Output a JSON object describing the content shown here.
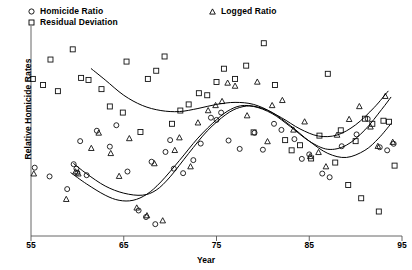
{
  "chart_data": {
    "type": "scatter",
    "title": "",
    "xlabel": "Year",
    "ylabel": "Relative Homicide Rates",
    "xlim": [
      55,
      95
    ],
    "ylim": [
      0,
      100
    ],
    "xticks": [
      55,
      65,
      75,
      85,
      95
    ],
    "yticks": [],
    "grid": false,
    "legend_position": "top",
    "axis_style": "left-spine-and-bottom-axis",
    "series": [
      {
        "name": "Homicide Ratio",
        "marker": "circle-open",
        "color": "#000000",
        "points": [
          [
            55.4,
            33.5
          ],
          [
            57.0,
            29.2
          ],
          [
            58.9,
            23.0
          ],
          [
            59.6,
            35.2
          ],
          [
            59.9,
            33.0
          ],
          [
            60.0,
            31.0
          ],
          [
            60.3,
            46.5
          ],
          [
            61.0,
            29.8
          ],
          [
            62.1,
            51.6
          ],
          [
            63.5,
            43.8
          ],
          [
            64.2,
            54.3
          ],
          [
            65.4,
            31.6
          ],
          [
            66.6,
            12.5
          ],
          [
            67.4,
            9.3
          ],
          [
            68.0,
            36.4
          ],
          [
            68.4,
            5.8
          ],
          [
            69.5,
            41.2
          ],
          [
            70.0,
            47.0
          ],
          [
            70.4,
            33.0
          ],
          [
            71.4,
            30.8
          ],
          [
            72.5,
            37.2
          ],
          [
            73.3,
            45.3
          ],
          [
            74.4,
            58.0
          ],
          [
            75.0,
            56.9
          ],
          [
            75.5,
            60.5
          ],
          [
            76.3,
            46.8
          ],
          [
            77.5,
            42.7
          ],
          [
            79.1,
            50.6
          ],
          [
            80.0,
            42.3
          ],
          [
            81.2,
            55.0
          ],
          [
            82.0,
            52.0
          ],
          [
            83.4,
            47.5
          ],
          [
            84.2,
            37.8
          ],
          [
            85.0,
            40.0
          ],
          [
            86.4,
            30.6
          ],
          [
            87.2,
            28.8
          ],
          [
            88.5,
            44.0
          ],
          [
            90.1,
            49.8
          ],
          [
            91.3,
            57.4
          ],
          [
            92.6,
            43.5
          ],
          [
            93.4,
            42.0
          ],
          [
            94.1,
            45.2
          ]
        ]
      },
      {
        "name": "Residual Deviation",
        "marker": "square-open",
        "color": "#000000",
        "points": [
          [
            55.2,
            77.0
          ],
          [
            56.3,
            74.0
          ],
          [
            57.1,
            86.5
          ],
          [
            57.9,
            71.0
          ],
          [
            59.5,
            91.5
          ],
          [
            60.4,
            77.5
          ],
          [
            61.2,
            76.5
          ],
          [
            62.6,
            72.0
          ],
          [
            63.5,
            63.5
          ],
          [
            64.9,
            60.5
          ],
          [
            65.3,
            85.5
          ],
          [
            66.8,
            51.0
          ],
          [
            67.6,
            77.0
          ],
          [
            68.5,
            81.0
          ],
          [
            69.4,
            88.0
          ],
          [
            70.2,
            55.0
          ],
          [
            71.1,
            61.5
          ],
          [
            72.0,
            64.5
          ],
          [
            73.1,
            70.0
          ],
          [
            74.0,
            69.0
          ],
          [
            75.0,
            75.5
          ],
          [
            75.8,
            82.0
          ],
          [
            77.0,
            77.0
          ],
          [
            78.2,
            83.5
          ],
          [
            79.0,
            50.8
          ],
          [
            80.1,
            94.5
          ],
          [
            81.3,
            74.0
          ],
          [
            82.4,
            47.0
          ],
          [
            83.1,
            42.0
          ],
          [
            84.0,
            44.5
          ],
          [
            85.2,
            38.0
          ],
          [
            86.1,
            49.2
          ],
          [
            87.0,
            79.5
          ],
          [
            87.8,
            36.0
          ],
          [
            88.4,
            51.8
          ],
          [
            89.2,
            25.0
          ],
          [
            90.0,
            46.5
          ],
          [
            90.6,
            18.5
          ],
          [
            91.0,
            57.5
          ],
          [
            91.8,
            55.0
          ],
          [
            92.5,
            12.0
          ],
          [
            93.0,
            56.5
          ],
          [
            93.6,
            56.0
          ],
          [
            94.2,
            34.5
          ]
        ]
      },
      {
        "name": "Logged Ratio",
        "marker": "triangle-open",
        "color": "#000000",
        "points": [
          [
            55.3,
            30.5
          ],
          [
            58.8,
            18.0
          ],
          [
            59.8,
            31.5
          ],
          [
            60.1,
            30.5
          ],
          [
            61.5,
            43.0
          ],
          [
            62.3,
            50.5
          ],
          [
            63.6,
            40.5
          ],
          [
            64.5,
            29.3
          ],
          [
            65.6,
            47.8
          ],
          [
            66.4,
            13.8
          ],
          [
            67.5,
            10.0
          ],
          [
            68.3,
            35.5
          ],
          [
            69.2,
            7.5
          ],
          [
            70.5,
            42.0
          ],
          [
            71.0,
            48.2
          ],
          [
            72.2,
            34.0
          ],
          [
            73.0,
            55.5
          ],
          [
            74.1,
            61.5
          ],
          [
            74.9,
            64.0
          ],
          [
            75.6,
            66.0
          ],
          [
            76.2,
            75.0
          ],
          [
            77.0,
            73.5
          ],
          [
            78.3,
            59.0
          ],
          [
            79.4,
            75.5
          ],
          [
            80.5,
            46.3
          ],
          [
            81.0,
            64.0
          ],
          [
            82.1,
            66.5
          ],
          [
            83.3,
            52.0
          ],
          [
            84.5,
            56.0
          ],
          [
            85.1,
            39.0
          ],
          [
            86.0,
            41.0
          ],
          [
            86.8,
            34.0
          ],
          [
            88.0,
            49.5
          ],
          [
            89.3,
            57.2
          ],
          [
            90.4,
            63.5
          ],
          [
            91.6,
            53.5
          ],
          [
            92.4,
            44.0
          ],
          [
            93.2,
            68.5
          ],
          [
            94.0,
            46.0
          ]
        ]
      }
    ],
    "fitted_curves": [
      {
        "name": "Residual Deviation trend",
        "for_series": "Residual Deviation",
        "path": [
          [
            61.5,
            82.0
          ],
          [
            63.0,
            76.5
          ],
          [
            65.0,
            69.0
          ],
          [
            67.0,
            64.0
          ],
          [
            69.0,
            61.5
          ],
          [
            71.0,
            61.0
          ],
          [
            73.0,
            62.5
          ],
          [
            75.0,
            64.5
          ],
          [
            77.0,
            65.5
          ],
          [
            79.0,
            64.5
          ],
          [
            81.0,
            60.5
          ],
          [
            83.0,
            54.0
          ],
          [
            85.0,
            46.5
          ],
          [
            87.0,
            40.5
          ],
          [
            89.0,
            38.5
          ],
          [
            91.0,
            42.0
          ],
          [
            92.5,
            48.0
          ],
          [
            93.8,
            55.0
          ]
        ]
      },
      {
        "name": "Homicide Ratio trend",
        "for_series": "Homicide Ratio",
        "path": [
          [
            59.6,
            35.5
          ],
          [
            61.0,
            30.5
          ],
          [
            63.0,
            24.5
          ],
          [
            65.0,
            21.0
          ],
          [
            67.0,
            20.0
          ],
          [
            68.5,
            22.5
          ],
          [
            70.0,
            29.0
          ],
          [
            72.0,
            40.5
          ],
          [
            74.0,
            51.5
          ],
          [
            76.0,
            59.5
          ],
          [
            77.5,
            63.0
          ],
          [
            79.0,
            63.5
          ],
          [
            81.0,
            60.0
          ],
          [
            83.0,
            53.5
          ],
          [
            85.0,
            46.5
          ],
          [
            87.0,
            42.5
          ],
          [
            89.0,
            44.5
          ],
          [
            91.0,
            52.0
          ],
          [
            92.8,
            62.0
          ],
          [
            93.8,
            68.0
          ]
        ]
      },
      {
        "name": "Logged Ratio trend",
        "for_series": "Logged Ratio",
        "path": [
          [
            59.3,
            31.0
          ],
          [
            61.0,
            25.5
          ],
          [
            63.0,
            20.0
          ],
          [
            64.5,
            17.5
          ],
          [
            66.0,
            17.5
          ],
          [
            67.5,
            20.5
          ],
          [
            69.0,
            26.5
          ],
          [
            71.0,
            37.0
          ],
          [
            73.0,
            48.0
          ],
          [
            75.0,
            57.0
          ],
          [
            76.5,
            62.0
          ],
          [
            78.0,
            64.0
          ],
          [
            80.0,
            62.5
          ],
          [
            82.0,
            58.0
          ],
          [
            84.0,
            52.5
          ],
          [
            86.0,
            49.0
          ],
          [
            88.0,
            49.5
          ],
          [
            90.0,
            54.5
          ],
          [
            92.0,
            63.0
          ],
          [
            93.5,
            71.0
          ]
        ]
      }
    ]
  },
  "legend": {
    "items": [
      {
        "label": "Homicide Ratio",
        "marker": "circle-open"
      },
      {
        "label": "Residual Deviation",
        "marker": "square-open"
      },
      {
        "label": "Logged Ratio",
        "marker": "triangle-open"
      }
    ]
  },
  "axes": {
    "x_label": "Year",
    "y_label": "Relative Homicide Rates",
    "x_tick_labels": [
      "55",
      "65",
      "75",
      "85",
      "95"
    ]
  }
}
